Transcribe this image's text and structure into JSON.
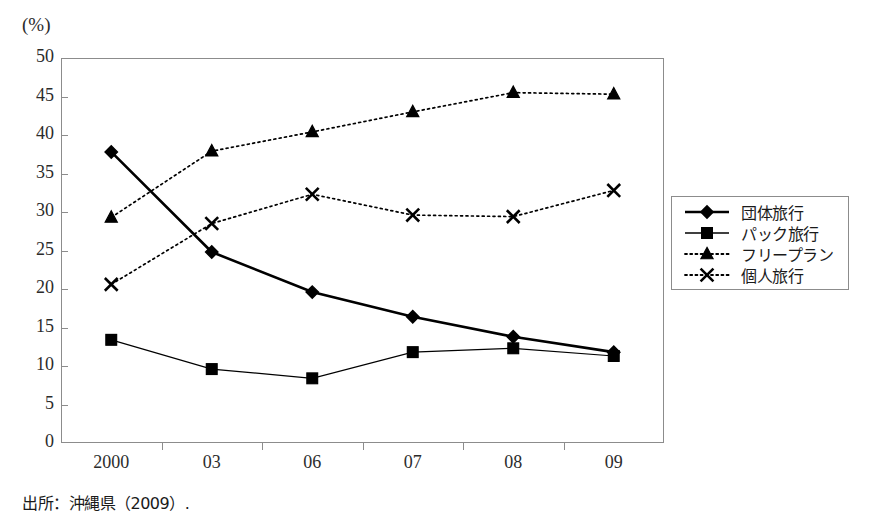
{
  "chart_data": {
    "type": "line",
    "title": "",
    "xlabel": "",
    "ylabel": "(%)",
    "ylim": [
      0,
      50
    ],
    "ytick_step": 5,
    "yticks": [
      50,
      45,
      40,
      35,
      30,
      25,
      20,
      15,
      10,
      5,
      0
    ],
    "categories": [
      "2000",
      "03",
      "06",
      "07",
      "08",
      "09"
    ],
    "grid": false,
    "legend_position": "right",
    "series": [
      {
        "name": "団体旅行",
        "marker": "diamond",
        "line_style": "solid",
        "line_width": "thick",
        "color": "#000000",
        "values": [
          37.8,
          24.8,
          19.6,
          16.4,
          13.8,
          11.8
        ]
      },
      {
        "name": "パック旅行",
        "marker": "square",
        "line_style": "solid",
        "line_width": "thin",
        "color": "#000000",
        "values": [
          13.4,
          9.6,
          8.4,
          11.8,
          12.3,
          11.3
        ]
      },
      {
        "name": "フリープラン",
        "marker": "triangle",
        "line_style": "dotted",
        "line_width": "thin",
        "color": "#000000",
        "values": [
          29.3,
          37.9,
          40.4,
          43.0,
          45.5,
          45.3
        ]
      },
      {
        "name": "個人旅行",
        "marker": "cross",
        "line_style": "dotted",
        "line_width": "thin",
        "color": "#000000",
        "values": [
          20.6,
          28.5,
          32.3,
          29.6,
          29.4,
          32.8
        ]
      }
    ]
  },
  "axis": {
    "unit_label": "(%)"
  },
  "legend": {
    "items": [
      {
        "label": "団体旅行"
      },
      {
        "label": "パック旅行"
      },
      {
        "label": "フリープラン"
      },
      {
        "label": "個人旅行"
      }
    ]
  },
  "footer": {
    "source": "出所：沖縄県（2009）."
  }
}
